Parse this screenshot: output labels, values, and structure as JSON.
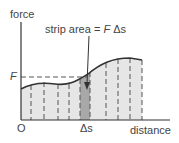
{
  "diagram": {
    "y_axis_label": "force",
    "x_axis_label": "distance",
    "origin_label": "O",
    "f_label": "F",
    "delta_s_label": "Δs",
    "annotation": {
      "prefix": "strip area = ",
      "symbol_f": "F",
      "symbol_ds": " Δs"
    },
    "colors": {
      "axis": "#333333",
      "curve": "#333333",
      "fill": "#e6e6e6",
      "strip_fill": "#a8a8a8",
      "dash": "#555555",
      "text": "#444444"
    }
  }
}
